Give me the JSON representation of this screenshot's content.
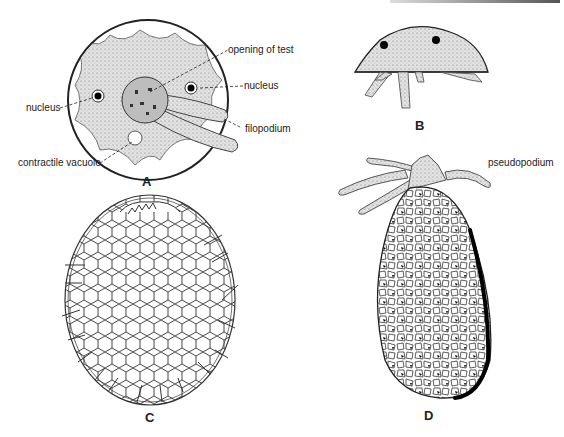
{
  "figure": {
    "panels": [
      {
        "id": "A",
        "letter": "A",
        "labels": {
          "opening": "opening of test",
          "nucleus_right": "nucleus",
          "nucleus_left": "nucleus",
          "filopodium": "filopodium",
          "vacuole": "contractile vacuole"
        }
      },
      {
        "id": "B",
        "letter": "B"
      },
      {
        "id": "C",
        "letter": "C"
      },
      {
        "id": "D",
        "letter": "D",
        "labels": {
          "pseudopodium": "pseudopodium"
        }
      }
    ],
    "colors": {
      "ink": "#222222",
      "cytoplasm": "#d9d9d9",
      "background": "#ffffff"
    }
  }
}
